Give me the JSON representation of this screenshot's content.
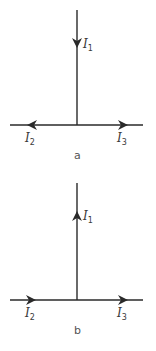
{
  "diagrams": [
    {
      "caption": "a",
      "labels": {
        "top": "I",
        "top_sub": "1",
        "left": "I",
        "left_sub": "2",
        "right": "I",
        "right_sub": "3"
      },
      "arrows": {
        "vertical": "down",
        "left": "left",
        "right": "right"
      }
    },
    {
      "caption": "b",
      "labels": {
        "top": "I",
        "top_sub": "1",
        "left": "I",
        "left_sub": "2",
        "right": "I",
        "right_sub": "3"
      },
      "arrows": {
        "vertical": "up",
        "left": "right",
        "right": "right"
      }
    }
  ],
  "colors": {
    "line": "#2a2a2a",
    "text": "#3a3a3a"
  }
}
